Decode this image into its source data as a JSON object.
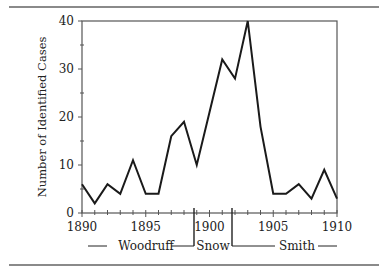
{
  "chart_data": {
    "type": "line",
    "title": "",
    "xlabel": "",
    "ylabel": "Number of Identified Cases",
    "x": [
      1890,
      1891,
      1892,
      1893,
      1894,
      1895,
      1896,
      1897,
      1898,
      1899,
      1900,
      1901,
      1902,
      1903,
      1904,
      1905,
      1906,
      1907,
      1908,
      1909,
      1910
    ],
    "series": [
      {
        "name": "Identified Cases",
        "values": [
          6,
          2,
          6,
          4,
          11,
          4,
          4,
          16,
          19,
          10,
          21,
          32,
          28,
          40,
          18,
          4,
          4,
          6,
          3,
          9,
          3
        ]
      }
    ],
    "xlim": [
      1890,
      1910
    ],
    "ylim": [
      0,
      40
    ],
    "x_ticks": [
      "1890",
      "1895",
      "1900",
      "1905",
      "1910"
    ],
    "y_ticks": [
      "0",
      "10",
      "20",
      "30",
      "40"
    ],
    "grid": false,
    "legend": null,
    "annotations": {
      "periods": [
        {
          "label": "Woodruff",
          "start": 1890,
          "end": 1899
        },
        {
          "label": "Snow",
          "start": 1899,
          "end": 1902
        },
        {
          "label": "Smith",
          "start": 1902,
          "end": 1910
        }
      ]
    }
  },
  "labels": {
    "ylabel": "Number of Identified Cases",
    "yticks": [
      "0",
      "10",
      "20",
      "30",
      "40"
    ],
    "xticks": [
      "1890",
      "1895",
      "1900",
      "1905",
      "1910"
    ],
    "periods": [
      "Woodruff",
      "Snow",
      "Smith"
    ]
  }
}
